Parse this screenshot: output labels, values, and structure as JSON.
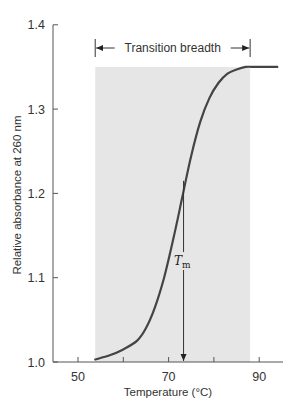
{
  "chart_data": {
    "type": "line",
    "title": "",
    "xlabel": "Temperature (°C)",
    "ylabel": "Relative absorbance at 260 nm",
    "xlim": [
      44.5,
      95.5
    ],
    "ylim": [
      1.0,
      1.4
    ],
    "x_ticks": [
      50,
      60,
      70,
      80,
      90
    ],
    "x_tick_labels": [
      "50",
      "70",
      "90"
    ],
    "y_ticks": [
      1.0,
      1.1,
      1.2,
      1.3,
      1.4
    ],
    "y_tick_labels": [
      "1.0",
      "1.1",
      "1.2",
      "1.3",
      "1.4"
    ],
    "grid": false,
    "legend": null,
    "series": [
      {
        "name": "DNA melting curve",
        "color": "#444444",
        "x": [
          53.8,
          57,
          60,
          63,
          65,
          67,
          69,
          71,
          73,
          75,
          77,
          79,
          81,
          83,
          85,
          87,
          89,
          91,
          94
        ],
        "y": [
          1.003,
          1.008,
          1.015,
          1.025,
          1.04,
          1.065,
          1.1,
          1.145,
          1.195,
          1.245,
          1.285,
          1.313,
          1.331,
          1.342,
          1.347,
          1.35,
          1.35,
          1.35,
          1.35
        ]
      }
    ],
    "shaded_region": {
      "x_start": 53.8,
      "x_end": 88.0,
      "y_top": 1.35,
      "color": "#e6e6e6"
    },
    "annotations": [
      {
        "type": "double-arrow",
        "text": "Transition breadth",
        "x_start": 53.8,
        "x_end": 88.0,
        "y": 1.37
      },
      {
        "type": "arrow-down",
        "text": "T",
        "subscript": "m",
        "x": 73.3,
        "y_start": 1.215,
        "y_end": 1.0
      }
    ]
  },
  "labels": {
    "xlabel": "Temperature (°C)",
    "ylabel": "Relative absorbance at 260 nm",
    "breadth": "Transition breadth",
    "tm_main": "T",
    "tm_sub": "m"
  }
}
